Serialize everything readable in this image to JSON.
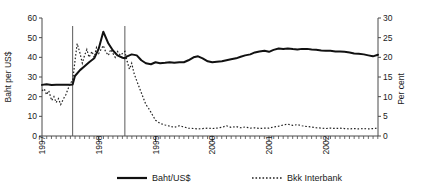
{
  "chart_data": {
    "type": "line",
    "title": "",
    "xlabel": "",
    "ylabel": "Baht per US$",
    "ylabel_right": "Per cent",
    "ylim": [
      0,
      60
    ],
    "ylim_right": [
      0,
      30
    ],
    "grid": false,
    "legend_position": "bottom",
    "x_tick_labels": [
      "1997",
      "1998",
      "1999",
      "2000",
      "2001",
      "2002"
    ],
    "y_tick_labels": [
      "0",
      "10",
      "20",
      "30",
      "40",
      "50",
      "60"
    ],
    "y_tick_values": [
      0,
      10,
      20,
      30,
      40,
      50,
      60
    ],
    "y_right_tick_labels": [
      "0",
      "5",
      "10",
      "15",
      "20",
      "25",
      "30"
    ],
    "y_right_tick_values": [
      0,
      5,
      10,
      15,
      20,
      25,
      30
    ],
    "x_start": 1997.0,
    "x_end": 2002.92,
    "annotations": [
      {
        "name": "baht-float-line",
        "x": 1997.54,
        "label": ""
      },
      {
        "name": "imf-program-line",
        "x": 1998.46,
        "label": ""
      }
    ],
    "series": [
      {
        "name": "Baht/US$",
        "axis": "left",
        "style": "solid",
        "color": "#111111",
        "x": [
          1997.0,
          1997.08,
          1997.17,
          1997.25,
          1997.33,
          1997.42,
          1997.5,
          1997.54,
          1997.58,
          1997.67,
          1997.75,
          1997.83,
          1997.92,
          1998.0,
          1998.08,
          1998.17,
          1998.25,
          1998.33,
          1998.42,
          1998.46,
          1998.5,
          1998.58,
          1998.67,
          1998.75,
          1998.83,
          1998.92,
          1999.0,
          1999.08,
          1999.17,
          1999.25,
          1999.33,
          1999.42,
          1999.5,
          1999.58,
          1999.67,
          1999.75,
          1999.83,
          1999.92,
          2000.0,
          2000.08,
          2000.17,
          2000.25,
          2000.33,
          2000.42,
          2000.5,
          2000.58,
          2000.67,
          2000.75,
          2000.83,
          2000.92,
          2001.0,
          2001.08,
          2001.17,
          2001.25,
          2001.33,
          2001.42,
          2001.5,
          2001.58,
          2001.67,
          2001.75,
          2001.83,
          2001.92,
          2002.0,
          2002.08,
          2002.17,
          2002.25,
          2002.33,
          2002.42,
          2002.5,
          2002.58,
          2002.67,
          2002.75,
          2002.83,
          2002.92
        ],
        "values": [
          26.0,
          26.3,
          25.9,
          26.0,
          26.0,
          26.0,
          26.1,
          26.2,
          30.5,
          33.5,
          35.5,
          37.5,
          39.5,
          44.5,
          53.0,
          47.0,
          43.5,
          41.0,
          39.8,
          39.5,
          40.5,
          41.5,
          41.0,
          38.5,
          37.0,
          36.5,
          37.5,
          37.0,
          37.2,
          37.5,
          37.2,
          37.5,
          37.5,
          38.5,
          40.0,
          40.5,
          39.5,
          38.0,
          37.5,
          37.8,
          38.0,
          38.5,
          39.0,
          39.5,
          40.3,
          41.0,
          41.5,
          42.5,
          43.0,
          43.3,
          42.8,
          43.8,
          44.5,
          44.3,
          44.5,
          44.2,
          44.0,
          44.3,
          44.3,
          44.0,
          43.8,
          43.5,
          43.3,
          43.3,
          43.0,
          43.0,
          42.8,
          42.5,
          42.0,
          41.8,
          41.5,
          41.0,
          40.5,
          41.3
        ]
      },
      {
        "name": "Bkk Interbank",
        "axis": "right",
        "style": "dotted",
        "color": "#222222",
        "x": [
          1997.0,
          1997.04,
          1997.08,
          1997.12,
          1997.17,
          1997.21,
          1997.25,
          1997.29,
          1997.33,
          1997.38,
          1997.42,
          1997.46,
          1997.5,
          1997.54,
          1997.58,
          1997.62,
          1997.67,
          1997.71,
          1997.75,
          1997.79,
          1997.83,
          1997.88,
          1997.92,
          1997.96,
          1998.0,
          1998.04,
          1998.08,
          1998.12,
          1998.17,
          1998.21,
          1998.25,
          1998.29,
          1998.33,
          1998.38,
          1998.42,
          1998.46,
          1998.5,
          1998.54,
          1998.58,
          1998.62,
          1998.67,
          1998.71,
          1998.75,
          1998.79,
          1998.83,
          1998.88,
          1998.92,
          1998.96,
          1999.0,
          1999.08,
          1999.17,
          1999.25,
          1999.33,
          1999.42,
          1999.5,
          1999.58,
          1999.67,
          1999.75,
          1999.83,
          1999.92,
          2000.0,
          2000.08,
          2000.17,
          2000.25,
          2000.33,
          2000.42,
          2000.5,
          2000.58,
          2000.67,
          2000.75,
          2000.83,
          2000.92,
          2001.0,
          2001.08,
          2001.17,
          2001.25,
          2001.33,
          2001.42,
          2001.5,
          2001.58,
          2001.67,
          2001.75,
          2001.83,
          2001.92,
          2002.0,
          2002.08,
          2002.17,
          2002.25,
          2002.33,
          2002.42,
          2002.5,
          2002.58,
          2002.67,
          2002.75,
          2002.83,
          2002.92
        ],
        "values": [
          11.5,
          12.0,
          10.5,
          11.5,
          9.0,
          10.0,
          8.5,
          9.5,
          8.0,
          9.5,
          10.5,
          12.0,
          13.5,
          14.0,
          19.0,
          23.5,
          21.0,
          18.5,
          20.5,
          22.0,
          20.0,
          21.5,
          20.0,
          22.5,
          21.0,
          22.0,
          23.0,
          21.5,
          20.5,
          22.0,
          21.0,
          20.0,
          21.5,
          20.5,
          21.0,
          21.5,
          19.0,
          17.0,
          18.5,
          16.0,
          14.0,
          12.5,
          11.0,
          9.5,
          8.0,
          7.0,
          6.0,
          5.0,
          4.0,
          3.2,
          2.8,
          2.5,
          2.2,
          2.6,
          2.3,
          2.0,
          1.9,
          1.8,
          1.9,
          2.0,
          1.9,
          2.0,
          2.2,
          2.6,
          2.2,
          2.4,
          2.1,
          2.3,
          2.0,
          2.1,
          1.9,
          2.0,
          2.0,
          2.3,
          2.5,
          2.8,
          3.0,
          2.7,
          2.9,
          2.6,
          2.4,
          2.3,
          2.1,
          2.0,
          1.9,
          2.0,
          1.9,
          2.0,
          1.9,
          1.8,
          1.9,
          1.8,
          1.9,
          1.8,
          1.9,
          2.0
        ]
      }
    ],
    "legend": [
      {
        "label": "Baht/US$",
        "style": "solid"
      },
      {
        "label": "Bkk Interbank",
        "style": "dotted"
      }
    ]
  }
}
